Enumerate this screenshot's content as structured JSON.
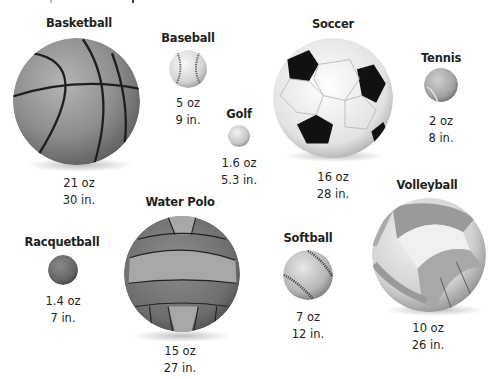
{
  "balls": [
    {
      "id": "basketball",
      "name": "Basketball",
      "weight": "21 oz",
      "circumference": "30 in."
    },
    {
      "id": "baseball",
      "name": "Baseball",
      "weight": "5 oz",
      "circumference": "9 in."
    },
    {
      "id": "golf",
      "name": "Golf",
      "weight": "1.6 oz",
      "circumference": "5.3 in."
    },
    {
      "id": "soccer",
      "name": "Soccer",
      "weight": "16 oz",
      "circumference": "28 in."
    },
    {
      "id": "tennis",
      "name": "Tennis",
      "weight": "2 oz",
      "circumference": "8 in."
    },
    {
      "id": "racquetball",
      "name": "Racquetball",
      "weight": "1.4 oz",
      "circumference": "7 in."
    },
    {
      "id": "water-polo",
      "name": "Water Polo",
      "weight": "15 oz",
      "circumference": "27 in."
    },
    {
      "id": "softball",
      "name": "Softball",
      "weight": "7 oz",
      "circumference": "12 in."
    },
    {
      "id": "volleyball",
      "name": "Volleyball",
      "weight": "10 oz",
      "circumference": "26 in."
    }
  ],
  "colors": {
    "text": "#231f20",
    "ball_dark": "#555555",
    "ball_mid": "#8a8a8a",
    "ball_light": "#d9d9d9"
  }
}
